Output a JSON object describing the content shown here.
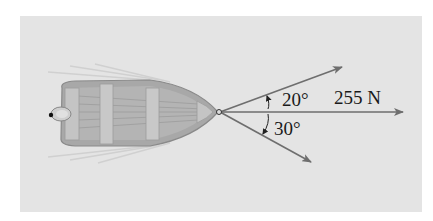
{
  "figure": {
    "forces": [
      {
        "name": "upper-rope",
        "angle_from_center_deg": 20,
        "direction": "above"
      },
      {
        "name": "center-rope",
        "magnitude_label": "255 N",
        "angle_from_center_deg": 0
      },
      {
        "name": "lower-rope",
        "angle_from_center_deg": 30,
        "direction": "below"
      }
    ],
    "labels": {
      "upper_angle": "20°",
      "lower_angle": "30°",
      "force": "255 N"
    },
    "colors": {
      "background": "#e4e4e4",
      "arrow": "#6e6e6e",
      "boat_hull": "#9a9a9a",
      "boat_inner": "#b5b5b5"
    }
  }
}
